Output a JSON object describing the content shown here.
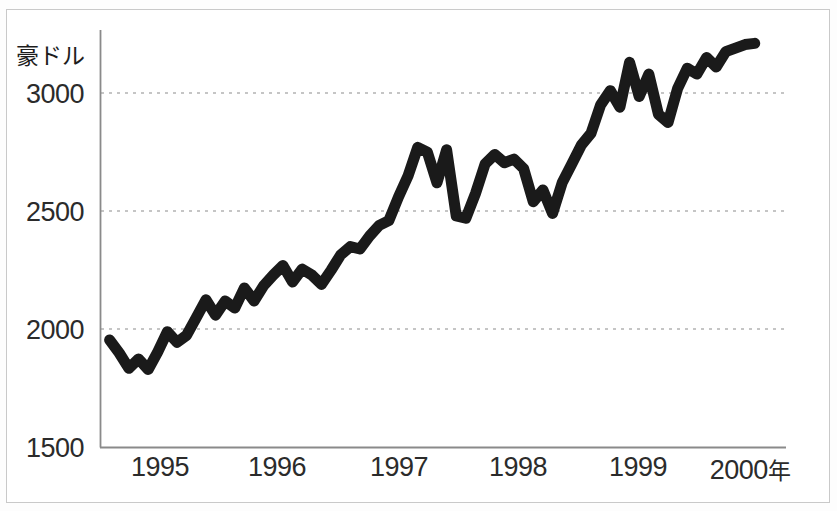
{
  "chart_data": {
    "type": "line",
    "title": "",
    "subtitle": "",
    "xlabel": "年",
    "ylabel": "豪ドル",
    "ylim": [
      1500,
      3250
    ],
    "xlim": [
      1994.5,
      2000.2
    ],
    "grid": true,
    "grid_style": "dotted-horizontal",
    "legend": null,
    "legend_position": "none",
    "y_ticks": [
      "1500",
      "2000",
      "2500",
      "3000"
    ],
    "y_tick_values": [
      1500,
      2000,
      2500,
      3000
    ],
    "x_ticks": [
      "1995",
      "1996",
      "1997",
      "1998",
      "1999",
      "2000"
    ],
    "x_tick_values": [
      1995,
      1996,
      1997,
      1998,
      1999,
      2000
    ],
    "x_axis_suffix": "年",
    "line_color": "#1a1a1a",
    "line_width": 11,
    "series": [
      {
        "name": "豪ドル",
        "x": [
          1994.58,
          1994.66,
          1994.74,
          1994.82,
          1994.9,
          1994.98,
          1995.06,
          1995.14,
          1995.22,
          1995.3,
          1995.38,
          1995.46,
          1995.54,
          1995.62,
          1995.7,
          1995.78,
          1995.86,
          1995.94,
          1996.02,
          1996.1,
          1996.18,
          1996.26,
          1996.34,
          1996.42,
          1996.5,
          1996.58,
          1996.66,
          1996.74,
          1996.82,
          1996.9,
          1996.98,
          1997.06,
          1997.14,
          1997.22,
          1997.3,
          1997.38,
          1997.46,
          1997.54,
          1997.62,
          1997.7,
          1997.78,
          1997.86,
          1997.94,
          1998.02,
          1998.1,
          1998.18,
          1998.26,
          1998.34,
          1998.42,
          1998.5,
          1998.58,
          1998.66,
          1998.74,
          1998.82,
          1998.9,
          1998.98,
          1999.06,
          1999.14,
          1999.22,
          1999.3,
          1999.38,
          1999.46,
          1999.54,
          1999.62,
          1999.7,
          1999.78,
          1999.86,
          1999.94
        ],
        "values": [
          1955,
          1900,
          1835,
          1875,
          1830,
          1905,
          1990,
          1945,
          1975,
          2050,
          2125,
          2060,
          2120,
          2090,
          2175,
          2120,
          2185,
          2230,
          2270,
          2200,
          2255,
          2230,
          2190,
          2250,
          2315,
          2350,
          2340,
          2395,
          2440,
          2460,
          2560,
          2650,
          2770,
          2750,
          2620,
          2760,
          2480,
          2470,
          2575,
          2700,
          2740,
          2705,
          2720,
          2680,
          2540,
          2590,
          2490,
          2620,
          2700,
          2780,
          2830,
          2950,
          3010,
          2940,
          3130,
          2985,
          3080,
          2910,
          2875,
          3020,
          3105,
          3080,
          3150,
          3110,
          3175,
          3190,
          3205,
          3210
        ],
        "color": "#1a1a1a"
      }
    ]
  },
  "axis": {
    "y_unit_label": "豪ドル",
    "y_ticks": [
      {
        "label": "3000",
        "top": 79
      },
      {
        "label": "2500",
        "top": 197
      },
      {
        "label": "2000",
        "top": 315
      },
      {
        "label": "1500",
        "top": 433
      }
    ],
    "x_ticks": [
      {
        "label": "1995",
        "suffix": "",
        "left": 100
      },
      {
        "label": "1996",
        "suffix": "",
        "left": 217
      },
      {
        "label": "1997",
        "suffix": "",
        "left": 339
      },
      {
        "label": "1998",
        "suffix": "",
        "left": 458
      },
      {
        "label": "1999",
        "suffix": "",
        "left": 578
      },
      {
        "label": "2000",
        "suffix": "年",
        "left": 690
      }
    ]
  }
}
